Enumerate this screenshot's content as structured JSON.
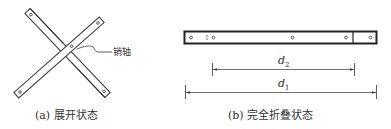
{
  "figure_a": {
    "caption": "(a) 展开状态",
    "pin_label": "销轴"
  },
  "figure_b": {
    "caption": "(b) 完全折叠状态",
    "dimensions": [
      {
        "symbol": "d",
        "subscript": "2"
      },
      {
        "symbol": "d",
        "subscript": "1"
      }
    ]
  },
  "colors": {
    "stroke": "#333333",
    "background": "#ffffff"
  }
}
